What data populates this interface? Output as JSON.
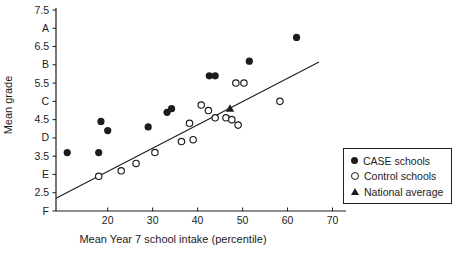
{
  "colors": {
    "foreground": "#1c1c1c",
    "background": "#ffffff"
  },
  "axes": {
    "x_title": "Mean Year 7 school intake (percentile)",
    "y_title": "Mean grade"
  },
  "legend": {
    "items": [
      {
        "label": "CASE schools",
        "marker": "filled-circle"
      },
      {
        "label": "Control schools",
        "marker": "open-circle"
      },
      {
        "label": "National average",
        "marker": "filled-triangle"
      }
    ]
  },
  "chart_data": {
    "type": "scatter",
    "title": "",
    "xlabel": "Mean Year 7 school intake (percentile)",
    "ylabel": "Mean grade",
    "xlim": [
      8.5,
      73
    ],
    "ylim": [
      2.0,
      7.5
    ],
    "grid": false,
    "legend_position": "right",
    "x_ticks": [
      20,
      30,
      40,
      50,
      60,
      70
    ],
    "y_ticks": [
      {
        "value": 7.5,
        "label": "7.5"
      },
      {
        "value": 7.0,
        "label": "A"
      },
      {
        "value": 6.5,
        "label": "6.5"
      },
      {
        "value": 6.0,
        "label": "B"
      },
      {
        "value": 5.5,
        "label": "5.5"
      },
      {
        "value": 5.0,
        "label": "C"
      },
      {
        "value": 4.5,
        "label": "4.5"
      },
      {
        "value": 4.0,
        "label": "D"
      },
      {
        "value": 3.5,
        "label": "3.5"
      },
      {
        "value": 3.0,
        "label": "E"
      },
      {
        "value": 2.5,
        "label": "2.5"
      },
      {
        "value": 2.0,
        "label": "F"
      }
    ],
    "series": [
      {
        "name": "CASE schools",
        "marker": "filled-circle",
        "points": [
          [
            11,
            3.6
          ],
          [
            18,
            3.6
          ],
          [
            18.5,
            4.45
          ],
          [
            20,
            4.2
          ],
          [
            29,
            4.3
          ],
          [
            33.2,
            4.7
          ],
          [
            34.2,
            4.8
          ],
          [
            42.6,
            5.7
          ],
          [
            43.9,
            5.7
          ],
          [
            51.5,
            6.1
          ],
          [
            62,
            6.75
          ]
        ]
      },
      {
        "name": "Control schools",
        "marker": "open-circle",
        "points": [
          [
            18,
            2.95
          ],
          [
            23,
            3.1
          ],
          [
            26.3,
            3.3
          ],
          [
            30.5,
            3.6
          ],
          [
            36.4,
            3.9
          ],
          [
            39,
            3.95
          ],
          [
            38.2,
            4.4
          ],
          [
            40.8,
            4.9
          ],
          [
            42.4,
            4.75
          ],
          [
            43.9,
            4.55
          ],
          [
            46.3,
            4.55
          ],
          [
            47.6,
            4.5
          ],
          [
            49,
            4.35
          ],
          [
            48.5,
            5.5
          ],
          [
            50.3,
            5.5
          ],
          [
            58.3,
            5.0
          ]
        ]
      },
      {
        "name": "National average",
        "marker": "filled-triangle",
        "points": [
          [
            47.2,
            4.8
          ]
        ]
      }
    ],
    "trend_line": {
      "x1": 8.5,
      "y1": 2.35,
      "x2": 67,
      "y2": 6.08
    }
  }
}
